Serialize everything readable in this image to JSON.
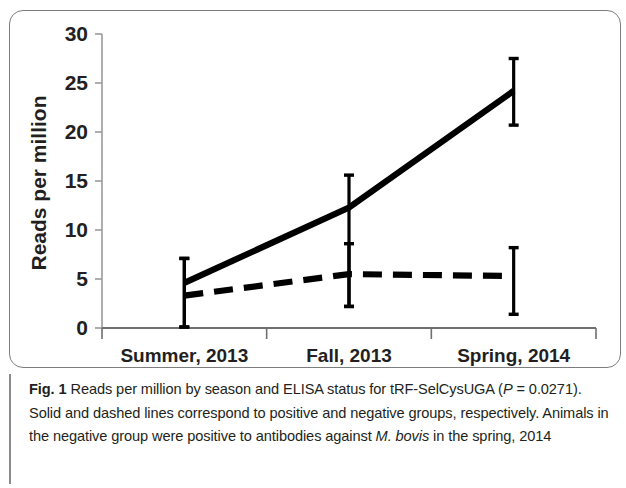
{
  "figure": {
    "label": "Fig. 1",
    "caption_part1": " Reads per million by season and ELISA status for tRF-SelCysUGA (",
    "caption_pvalue_italic": "P",
    "caption_part2": " = 0.0271). Solid and dashed lines correspond to positive and negative groups, respectively. Animals in the negative group were positive to antibodies against ",
    "caption_species_italic": "M. bovis",
    "caption_part3": " in the spring, 2014"
  },
  "chart_data": {
    "type": "line",
    "title": "",
    "xlabel": "",
    "ylabel": "Reads per million",
    "categories": [
      "Summer, 2013",
      "Fall, 2013",
      "Spring, 2014"
    ],
    "ylim": [
      0,
      30
    ],
    "yticks": [
      0,
      5,
      10,
      15,
      20,
      25,
      30
    ],
    "ytick_labels": [
      "0",
      "5",
      "10",
      "15",
      "20",
      "25",
      "30"
    ],
    "grid": false,
    "legend_position": "none",
    "series": [
      {
        "name": "positive",
        "line_style": "solid",
        "color": "#000000",
        "values": [
          4.6,
          12.3,
          24.2
        ],
        "error_low": [
          0.1,
          2.2,
          20.7
        ],
        "error_high": [
          7.1,
          15.6,
          27.5
        ]
      },
      {
        "name": "negative",
        "line_style": "dashed",
        "color": "#000000",
        "values": [
          3.3,
          5.5,
          5.3
        ],
        "error_low": [
          0.1,
          2.2,
          1.4
        ],
        "error_high": [
          7.1,
          8.6,
          8.2
        ]
      }
    ]
  }
}
